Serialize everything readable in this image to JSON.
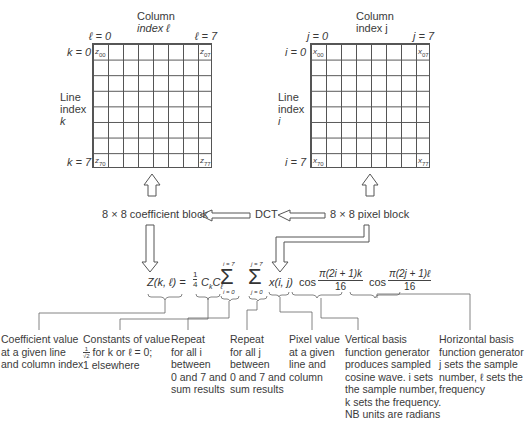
{
  "left_grid": {
    "column_header": [
      "Column",
      "index ℓ"
    ],
    "col_start": "ℓ = 0",
    "col_end": "ℓ = 7",
    "row_start": "k = 0",
    "row_end": "k = 7",
    "row_header": [
      "Line",
      "index",
      "k"
    ],
    "corner_symbol": "z",
    "corners": {
      "top_left": "00",
      "top_right": "07",
      "bottom_left": "70",
      "bottom_right": "77"
    }
  },
  "right_grid": {
    "column_header": [
      "Column",
      "index j"
    ],
    "col_start": "j = 0",
    "col_end": "j = 7",
    "row_start": "i = 0",
    "row_end": "i = 7",
    "row_header": [
      "Line",
      "index",
      "i"
    ],
    "corner_symbol": "x",
    "corners": {
      "top_left": "00",
      "top_right": "07",
      "bottom_left": "70",
      "bottom_right": "77"
    }
  },
  "flow": {
    "coefficient_block": "8 × 8 coefficient block",
    "dct": "DCT",
    "pixel_block": "8 × 8 pixel block"
  },
  "formula": {
    "lhs": "Z(k, ℓ) =",
    "frac_num": "1",
    "frac_den": "4",
    "constants": "CkCℓ",
    "sum1_top": "i = 7",
    "sum1_bottom": "i = 0",
    "sum2_top": "j = 7",
    "sum2_bottom": "j = 0",
    "sigma": "Σ",
    "pixel": "x(i, j)",
    "cos1": "cos",
    "cos1_num": "π(2i + 1)k",
    "cos1_den": "16",
    "cos2": "cos",
    "cos2_num": "π(2j + 1)ℓ",
    "cos2_den": "16"
  },
  "annotations": [
    {
      "lines": [
        "Coefficient value",
        "at a given line",
        "and column index"
      ]
    },
    {
      "lines": [
        "Constants of value",
        "for k or ℓ = 0;",
        "1 elsewhere"
      ],
      "fraction": {
        "num": "1",
        "den": "√2"
      }
    },
    {
      "lines": [
        "Repeat",
        "for all i",
        "between",
        "0 and 7 and",
        "sum results"
      ]
    },
    {
      "lines": [
        "Repeat",
        "for all j",
        "between",
        "0 and 7 and",
        "sum results"
      ]
    },
    {
      "lines": [
        "Pixel value",
        "at a given",
        "line and",
        "column"
      ]
    },
    {
      "lines": [
        "Vertical basis",
        "function generator",
        "produces sampled",
        "cosine wave. i sets",
        "the sample number,",
        "k sets the frequency.",
        "NB units are radians"
      ]
    },
    {
      "lines": [
        "Horizontal basis",
        "function generator",
        "j sets the sample",
        "number, ℓ sets the",
        "frequency"
      ]
    }
  ]
}
